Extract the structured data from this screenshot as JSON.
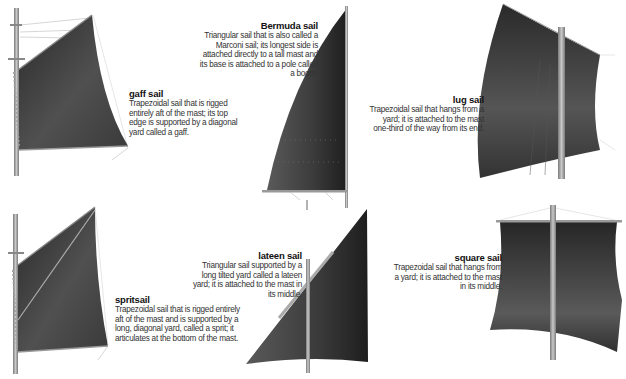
{
  "sails": [
    {
      "id": "gaff",
      "title": "gaff sail",
      "description": "Trapezoidal sail that is rigged entirely aft of the mast; its top edge is supported by a diagonal yard called a gaff."
    },
    {
      "id": "bermuda",
      "title": "Bermuda sail",
      "description": "Triangular sail that is also called a Marconi sail; its longest side is attached directly to a tall mast and its base is attached to a pole called a boom."
    },
    {
      "id": "lug",
      "title": "lug sail",
      "description": "Trapezoidal sail that hangs from a yard; it is attached to the mast one-third of the way from its end."
    },
    {
      "id": "spritsail",
      "title": "spritsail",
      "description": "Trapezoidal sail that is rigged entirely aft of the mast and is supported by a long, diagonal yard, called a sprit; it articulates at the bottom of the mast."
    },
    {
      "id": "lateen",
      "title": "lateen sail",
      "description": "Triangular sail supported by a long tilted yard called a lateen yard; it is attached to the mast in its middle."
    },
    {
      "id": "square",
      "title": "square sail",
      "description": "Trapezoidal sail that hangs from a yard; it is attached to the mast in its middle."
    }
  ],
  "colors": {
    "sail_dark": "#2e2e2e",
    "sail_mid": "#4a4a4a",
    "sail_light": "#6a6a6a",
    "mast": "#9a9a9a",
    "rope": "#bdbdbd",
    "background": "#ffffff"
  }
}
